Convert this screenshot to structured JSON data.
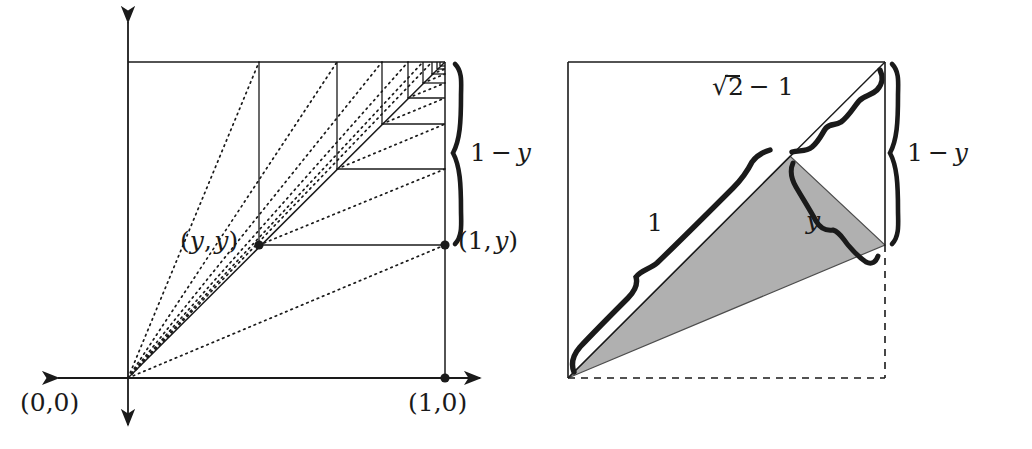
{
  "figure": {
    "title_hidden_artifact": "",
    "colors": {
      "ink": "#1a1a1a",
      "shade": "#b0b0b0",
      "shade_stroke": "#4d4d4d",
      "background": "#ffffff",
      "faint_artifact": "#f4f4f4"
    }
  },
  "left_panel": {
    "name": "unit-square-with-nested-squares",
    "axis": {
      "x_axis": "horizontal double-headed arrow",
      "y_axis": "vertical double-headed arrow"
    },
    "points": [
      {
        "id": "origin",
        "label_text": "(0,0)",
        "x": 128,
        "y": 378,
        "dot": false
      },
      {
        "id": "one-zero",
        "label_text": "(1,0)",
        "x": 445,
        "y": 378,
        "dot": true
      },
      {
        "id": "y-y",
        "label_text": "(y,y)",
        "x": 259,
        "y": 245,
        "dot": true
      },
      {
        "id": "one-y",
        "label_text": "(1,y)",
        "x": 445,
        "y": 245,
        "dot": true
      }
    ],
    "labels": {
      "origin": "(0,0)",
      "one_zero": "(1,0)",
      "y_y_open": "(",
      "y_y_first": "y",
      "y_y_comma": ",",
      "y_y_second": "y",
      "y_y_close": ")",
      "one_y_open": "(",
      "one_y_one": "1,",
      "one_y_y": "y",
      "one_y_close": ")"
    },
    "brace": {
      "label_lead": "1",
      "label_minus": "−",
      "label_var": "y",
      "full_text": "1 − y",
      "spans_from_y": 62,
      "spans_to_y": 245
    },
    "square": {
      "left": 128,
      "top": 62,
      "right": 445,
      "bottom": 378
    },
    "nested_levels": 7
  },
  "right_panel": {
    "name": "unit-square-with-shaded-triangle",
    "square": {
      "left": 568,
      "top": 62,
      "right": 885,
      "bottom": 378
    },
    "shaded_triangle": {
      "fill": "#b0b0b0",
      "vertices": [
        [
          568,
          378
        ],
        [
          790,
          156
        ],
        [
          885,
          245
        ]
      ]
    },
    "labels": {
      "sqrt_sym": "√",
      "sqrt_radicand": "2",
      "sqrt_rest": "− 1",
      "sqrt_full": "√2 − 1",
      "one": "1",
      "y": "y",
      "one_minus_y_lead": "1",
      "one_minus_y_minus": "−",
      "one_minus_y_var": "y",
      "one_minus_y_full": "1 − y"
    },
    "braces": [
      {
        "id": "sqrt2-minus-1-brace",
        "label": "√2 − 1",
        "along": "upper diagonal"
      },
      {
        "id": "one-brace",
        "label": "1",
        "along": "lower diagonal"
      },
      {
        "id": "y-brace",
        "label": "y",
        "along": "triangle right edge"
      },
      {
        "id": "one-minus-y-brace",
        "label": "1 − y",
        "along": "right side vertical"
      }
    ],
    "dashed_edges": [
      "bottom",
      "right-lower"
    ]
  }
}
